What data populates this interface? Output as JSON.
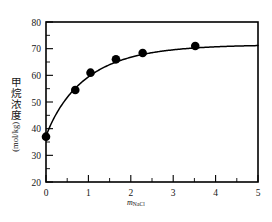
{
  "chart_data": {
    "type": "scatter",
    "title": "",
    "subtitle": "",
    "xlabel_symbol": "m",
    "xlabel_subscript": "NaCl",
    "xlabel": "m_NaCl",
    "ylabel_cjk": "甲烷浓度",
    "ylabel_units": "(mol/kg)",
    "ylabel": "甲烷浓度 (mol/kg)",
    "xlim": [
      0,
      5
    ],
    "ylim": [
      20,
      80
    ],
    "x_major_ticks": [
      0,
      1,
      2,
      3,
      4,
      5
    ],
    "x_tick_labels": [
      "0",
      "1",
      "2",
      "3",
      "4",
      "5"
    ],
    "x_minor_step": 0.5,
    "y_major_ticks": [
      20,
      30,
      40,
      50,
      60,
      70,
      80
    ],
    "y_tick_labels": [
      "20",
      "30",
      "40",
      "50",
      "60",
      "70",
      "80"
    ],
    "y_minor_step": 5,
    "grid": false,
    "legend": false,
    "legend_position": "none",
    "marker": "filled-circle",
    "marker_color": "#000000",
    "line_color": "#000000",
    "frame_color": "#000000",
    "background": "#ffffff",
    "series": [
      {
        "name": "methane concentration",
        "x": [
          0.0,
          0.69,
          1.05,
          1.65,
          2.28,
          3.52
        ],
        "values": [
          37.0,
          54.5,
          61.0,
          66.0,
          68.4,
          71.0
        ]
      }
    ],
    "fit_curve": {
      "description": "smooth saturating curve through points, asymptote near 71.5",
      "asymptote": 71.5,
      "x_start": 0.0,
      "x_end": 5.0
    }
  },
  "axis": {
    "x_title_note": "molality of NaCl",
    "y_title_note": "methane concentration in mol per kg"
  }
}
